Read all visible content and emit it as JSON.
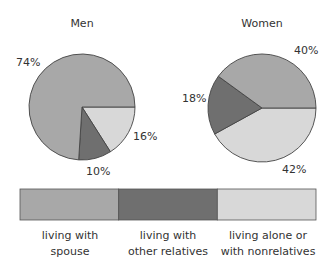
{
  "chart_data": {
    "type": "pie",
    "colors": {
      "living with spouse": "#a8a8a8",
      "living with other relatives": "#6f6f6f",
      "living alone or with nonrelatives": "#d8d8d8"
    },
    "charts": [
      {
        "title": "Men",
        "categories": [
          "living with spouse",
          "living with other relatives",
          "living alone or with nonrelatives"
        ],
        "values": [
          74,
          10,
          16
        ],
        "labels": [
          "74%",
          "10%",
          "16%"
        ]
      },
      {
        "title": "Women",
        "categories": [
          "living with spouse",
          "living with other relatives",
          "living alone or with nonrelatives"
        ],
        "values": [
          40,
          18,
          42
        ],
        "labels": [
          "40%",
          "18%",
          "42%"
        ]
      }
    ],
    "legend": {
      "position": "bottom",
      "entries": [
        {
          "line1": "living with",
          "line2": "spouse",
          "color": "#a8a8a8"
        },
        {
          "line1": "living with",
          "line2": "other relatives",
          "color": "#6f6f6f"
        },
        {
          "line1": "living alone or",
          "line2": "with nonrelatives",
          "color": "#d8d8d8"
        }
      ]
    }
  }
}
